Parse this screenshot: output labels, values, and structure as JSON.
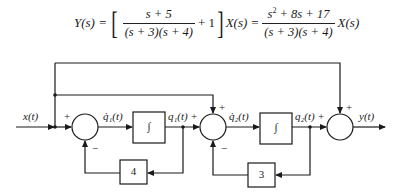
{
  "equation": {
    "lhs": "Y(s) =",
    "term1_num": "s + 5",
    "term1_den": "(s + 3)(s + 4)",
    "plus_one": "+ 1",
    "mid": "X(s) =",
    "term2_num_base": "s",
    "term2_num_exp": "2",
    "term2_num_rest": " + 8s + 17",
    "term2_den": "(s + 3)(s + 4)",
    "rhs_tail": "X(s)"
  },
  "diagram": {
    "input_label": "x(t)",
    "output_label": "y(t)",
    "summer1": {
      "plus": "+",
      "minus": "−"
    },
    "summer2": {
      "plus_top": "+",
      "plus_left": "+",
      "minus": "−"
    },
    "summer3": {
      "plus_top": "+",
      "plus_left": "+"
    },
    "q1dot_label": "q̇₁(t)",
    "q1_label": "q₁(t)",
    "q2dot_label": "q̇₂(t)",
    "q2_label": "q₂(t)",
    "integrator1": "∫",
    "integrator2": "∫",
    "gain1": "4",
    "gain2": "3"
  }
}
